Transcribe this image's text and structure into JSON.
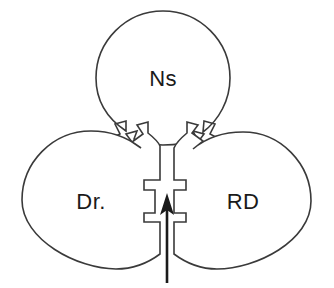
{
  "diagram": {
    "type": "jigsaw-venn-three-piece",
    "title": "",
    "background_color": "#ffffff",
    "outline_color": "#3a3a3a",
    "label_color": "#1a1a1a",
    "arrow_color": "#1a1a1a",
    "pieces": [
      {
        "id": "top",
        "label": "Ns",
        "position": "top-center",
        "center_x": 163,
        "center_y": 78,
        "radius": 67,
        "label_x": 163,
        "label_y": 80
      },
      {
        "id": "left",
        "label": "Dr.",
        "position": "bottom-left",
        "center_x": 91,
        "center_y": 200,
        "radius": 69,
        "label_x": 91,
        "label_y": 203
      },
      {
        "id": "right",
        "label": "RD",
        "position": "bottom-right",
        "center_x": 243,
        "center_y": 201,
        "radius": 68,
        "label_x": 243,
        "label_y": 203
      }
    ],
    "connectors": [
      {
        "id": "top-left-joint",
        "style": "zigzag-interlock",
        "between": [
          "Ns",
          "Dr."
        ]
      },
      {
        "id": "top-right-joint",
        "style": "zigzag-interlock",
        "between": [
          "Ns",
          "RD"
        ]
      },
      {
        "id": "bottom-center-joint",
        "style": "rectangular-tab-socket",
        "between": [
          "Dr.",
          "RD"
        ]
      }
    ],
    "arrow": {
      "id": "center-pointer",
      "direction": "up",
      "label": "",
      "tip_x": 167,
      "tip_y": 194,
      "tail_x": 167,
      "tail_y": 283
    }
  }
}
